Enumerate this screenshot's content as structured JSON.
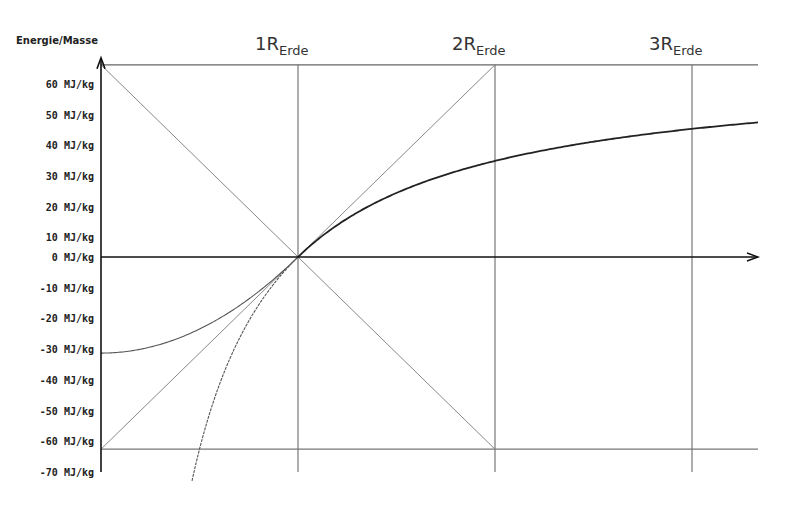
{
  "chart_data": {
    "type": "line",
    "title": "",
    "ylabel": "Energie/Masse",
    "xlabel": "",
    "y_unit": "MJ/kg",
    "y_ticks": [
      60,
      50,
      40,
      30,
      20,
      10,
      0,
      -10,
      -20,
      -30,
      -40,
      -50,
      -60,
      -70
    ],
    "y_tick_labels": [
      "60 MJ/kg",
      "50 MJ/kg",
      "40 MJ/kg",
      "30 MJ/kg",
      "20 MJ/kg",
      "10 MJ/kg",
      "0 MJ/kg",
      "-10 MJ/kg",
      "-20 MJ/kg",
      "-30 MJ/kg",
      "-40 MJ/kg",
      "-50 MJ/kg",
      "-60 MJ/kg",
      "-70 MJ/kg"
    ],
    "x_ticks": [
      1,
      2,
      3
    ],
    "x_tick_labels": [
      {
        "main": "1R",
        "sub": "Erde"
      },
      {
        "main": "2R",
        "sub": "Erde"
      },
      {
        "main": "3R",
        "sub": "Erde"
      }
    ],
    "xlim": [
      0,
      3.33
    ],
    "ylim": [
      -73,
      62.6
    ],
    "grid": true,
    "reference_levels": [
      62.6,
      0,
      -62.6
    ],
    "series": [
      {
        "name": "outer-potential-change",
        "x": [
          1,
          1.25,
          1.5,
          2,
          2.5,
          3,
          3.33
        ],
        "values": [
          0,
          12.5,
          20.9,
          31.3,
          37.6,
          41.7,
          43.8
        ]
      },
      {
        "name": "inner-potential",
        "x": [
          0,
          0.25,
          0.5,
          0.75,
          1
        ],
        "values": [
          -31.3,
          -29.3,
          -23.5,
          -13.7,
          0
        ]
      },
      {
        "name": "outer-formula-continued-inside",
        "x": [
          0.46,
          0.5,
          0.6,
          0.75,
          0.9,
          1
        ],
        "values": [
          -73.5,
          -62.6,
          -41.7,
          -20.9,
          -7.0,
          0
        ]
      },
      {
        "name": "diagonal-descending",
        "x": [
          0,
          2
        ],
        "values": [
          62.6,
          -62.6
        ]
      },
      {
        "name": "diagonal-ascending",
        "x": [
          0,
          2
        ],
        "values": [
          -62.6,
          62.6
        ]
      }
    ]
  }
}
